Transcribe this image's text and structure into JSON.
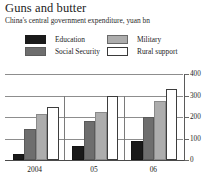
{
  "header": {
    "title": "Guns and butter",
    "subtitle": "China's central government expenditure, yuan bn"
  },
  "legend": {
    "items": [
      {
        "label": "Education",
        "color": "#1a1a1a",
        "icon": "legend-swatch-icon"
      },
      {
        "label": "Social Security",
        "color": "#6e6e6e",
        "icon": "legend-swatch-icon"
      },
      {
        "label": "Military",
        "color": "#adadad",
        "icon": "legend-swatch-icon"
      },
      {
        "label": "Rural support",
        "color": "#ffffff",
        "icon": "legend-swatch-icon"
      }
    ]
  },
  "axis": {
    "y_ticks": [
      "0",
      "100",
      "200",
      "300",
      "400"
    ],
    "x_ticks": [
      "2004",
      "05",
      "06"
    ]
  },
  "chart_data": {
    "type": "bar",
    "title": "Guns and butter",
    "subtitle": "China's central government expenditure, yuan bn",
    "xlabel": "",
    "ylabel": "yuan bn",
    "categories": [
      "2004",
      "05",
      "06"
    ],
    "series": [
      {
        "name": "Education",
        "color": "#1a1a1a",
        "values": [
          30,
          65,
          90
        ]
      },
      {
        "name": "Social Security",
        "color": "#6e6e6e",
        "values": [
          145,
          180,
          200
        ]
      },
      {
        "name": "Military",
        "color": "#adadad",
        "values": [
          215,
          225,
          275
        ]
      },
      {
        "name": "Rural support",
        "color": "#ffffff",
        "values": [
          245,
          300,
          330
        ]
      }
    ],
    "ylim": [
      0,
      400
    ],
    "ytick_values": [
      0,
      100,
      200,
      300,
      400
    ],
    "grid": true,
    "grid_axis": "y",
    "legend_position": "top",
    "units": "yuan bn"
  }
}
